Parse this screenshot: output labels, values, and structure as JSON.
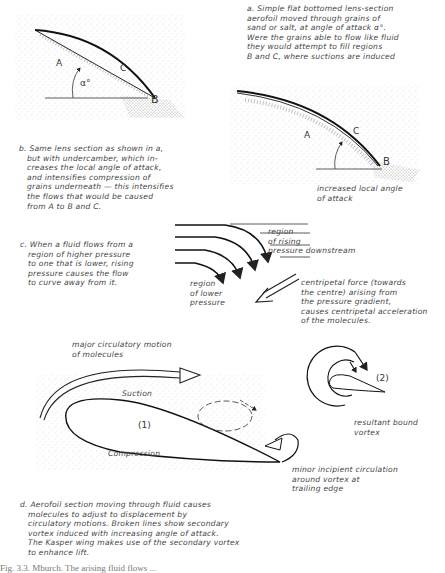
{
  "figure": {
    "panel_a": {
      "text": "a. Simple flat bottomed lens-section\naerofoil moved through grains of\nsand or salt, at angle of attack α°.\nWere the grains able to flow like fluid\nthey would attempt to fill regions\nB and C, where suctions are induced",
      "labels": {
        "A": "A",
        "B": "B",
        "C": "C",
        "alpha": "α°"
      }
    },
    "panel_b": {
      "text": "b. Same lens section as shown in a,\n   but with undercamber, which in-\n   creases the local angle of attack,\n   and intensifies compression of\n   grains underneath — this intensifies\n   the flows that would be caused\n   from A to B and C.",
      "labels": {
        "A": "A",
        "B": "B",
        "C": "C"
      },
      "annotation": "increased local angle\nof attack"
    },
    "panel_c": {
      "text": "c. When a fluid flows from a\n   region of higher pressure\n   to one that is lower, rising\n   pressure causes the flow\n   to curve away from it.",
      "region_rising": "region\nof rising\npressure downstream",
      "region_lower": "region\nof lower\npressure",
      "centripetal": "centripetal force (towards\nthe centre) arising from\nthe pressure gradient,\ncauses centripetal acceleration\nof the molecules."
    },
    "panel_d": {
      "major_motion": "major circulatory motion\nof molecules",
      "suction": "Suction",
      "compression": "Compression",
      "label_1": "(1)",
      "label_2": "(2)",
      "bound_vortex": "resultant bound\nvortex",
      "minor_circulation": "minor incipient circulation\naround vortex at\ntrailing edge",
      "text": "d. Aerofoil section moving through fluid causes\n   molecules to adjust to displacement by\n   circulatory motions. Broken lines show secondary\n   vortex induced with increasing angle of attack.\n   The Kasper wing makes use of the secondary vortex\n   to enhance lift."
    },
    "caption": "Fig. 3.3. Mburch. The arising fluid flows ..."
  }
}
